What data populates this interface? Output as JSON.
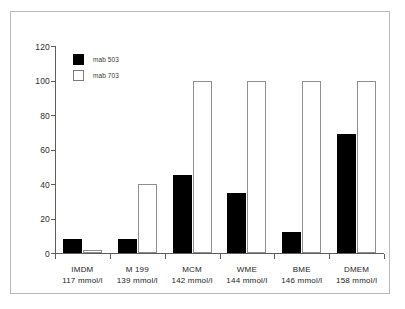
{
  "chart_data": {
    "type": "bar",
    "title": "",
    "subtitle": "",
    "xlabel": "",
    "ylabel": "",
    "ylim": [
      0,
      120
    ],
    "yticks": [
      0,
      20,
      40,
      60,
      80,
      100,
      120
    ],
    "grid": false,
    "legend_position": "top-left",
    "categories": [
      "IMDM",
      "M 199",
      "MCM",
      "WME",
      "BME",
      "DMEM"
    ],
    "category_sublabels": [
      "117 mmol/l",
      "139 mmol/l",
      "142 mmol/l",
      "144 mmol/l",
      "146 mmol/l",
      "158 mmol/l"
    ],
    "series": [
      {
        "name": "mab 503",
        "style": "filled-black",
        "color": "#000000",
        "values": [
          8,
          8,
          45,
          35,
          12,
          69
        ]
      },
      {
        "name": "mab 703",
        "style": "hollow-white",
        "color": "#ffffff",
        "values": [
          2,
          40,
          100,
          100,
          100,
          100
        ]
      }
    ]
  },
  "axis": {
    "y_tick_labels": [
      "0",
      "20",
      "40",
      "60",
      "80",
      "100",
      "120"
    ]
  },
  "legend": {
    "items": [
      {
        "label": "mab 503",
        "style": "filled"
      },
      {
        "label": "mab 703",
        "style": "hollow"
      }
    ]
  }
}
